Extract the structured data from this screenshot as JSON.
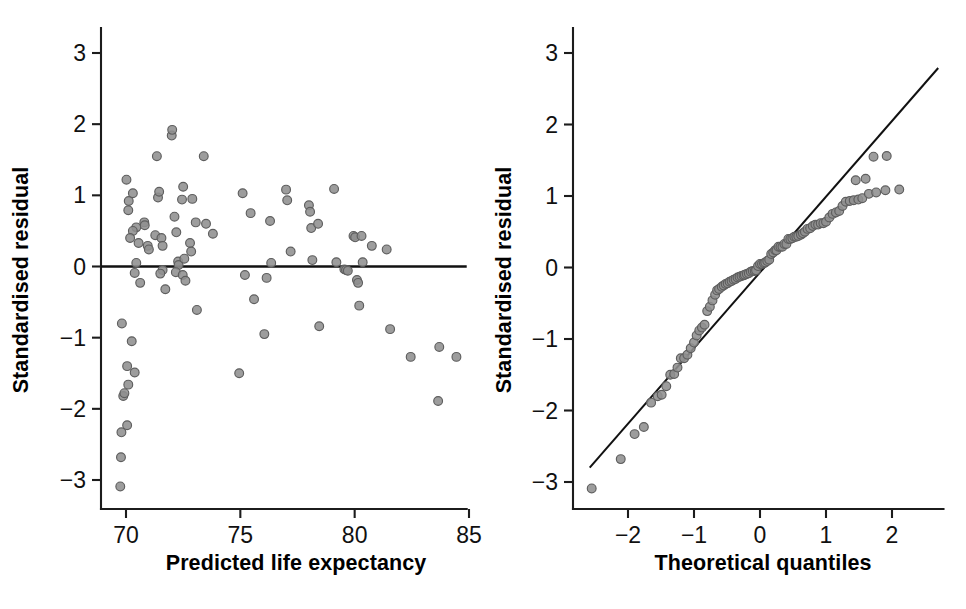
{
  "figure": {
    "background": "#ffffff",
    "point_fill": "#8f8f8f",
    "point_stroke": "#5e5e5e",
    "line_color": "#111111",
    "axis_color": "#1c1c1c",
    "panel_count": 2
  },
  "chart_data": [
    {
      "type": "scatter",
      "panel": "left",
      "title": "",
      "xlabel": "Predicted life expectancy",
      "ylabel": "Standardised residual",
      "xlim": [
        69.2,
        84.9
      ],
      "ylim": [
        -3.35,
        3.4
      ],
      "xticks": [
        70,
        75,
        80,
        85
      ],
      "xtick_labels": [
        "70",
        "75",
        "80",
        "85"
      ],
      "yticks": [
        -3,
        -2,
        -1,
        0,
        1,
        2,
        3
      ],
      "ytick_labels": [
        "−3",
        "−2",
        "−1",
        "0",
        "1",
        "2",
        "3"
      ],
      "grid": false,
      "legend": "none",
      "annotations": [
        {
          "kind": "hline",
          "y": 0,
          "label": "zero residual reference line"
        }
      ],
      "points": [
        [
          69.75,
          -3.09
        ],
        [
          69.78,
          -2.68
        ],
        [
          69.8,
          -2.33
        ],
        [
          70.05,
          -2.23
        ],
        [
          69.88,
          -1.82
        ],
        [
          69.93,
          -1.78
        ],
        [
          70.1,
          -1.66
        ],
        [
          70.05,
          -1.4
        ],
        [
          70.38,
          -1.49
        ],
        [
          70.25,
          -1.05
        ],
        [
          69.82,
          -0.8
        ],
        [
          70.02,
          1.22
        ],
        [
          70.12,
          0.92
        ],
        [
          70.1,
          0.79
        ],
        [
          70.3,
          1.03
        ],
        [
          70.45,
          0.55
        ],
        [
          70.3,
          0.5
        ],
        [
          70.18,
          0.4
        ],
        [
          70.55,
          0.33
        ],
        [
          70.45,
          0.05
        ],
        [
          70.38,
          -0.09
        ],
        [
          70.62,
          -0.23
        ],
        [
          70.8,
          0.62
        ],
        [
          70.82,
          0.58
        ],
        [
          70.95,
          0.29
        ],
        [
          71.0,
          0.24
        ],
        [
          71.35,
          1.55
        ],
        [
          71.4,
          0.97
        ],
        [
          71.45,
          1.05
        ],
        [
          71.28,
          0.44
        ],
        [
          71.55,
          0.4
        ],
        [
          71.6,
          0.29
        ],
        [
          71.6,
          -0.05
        ],
        [
          71.5,
          -0.1
        ],
        [
          71.72,
          -0.32
        ],
        [
          72.0,
          1.84
        ],
        [
          72.02,
          1.92
        ],
        [
          72.12,
          0.7
        ],
        [
          72.2,
          0.48
        ],
        [
          72.28,
          0.07
        ],
        [
          72.3,
          0.02
        ],
        [
          72.18,
          -0.08
        ],
        [
          72.45,
          0.94
        ],
        [
          72.5,
          1.12
        ],
        [
          72.55,
          0.11
        ],
        [
          72.48,
          -0.12
        ],
        [
          72.6,
          -0.2
        ],
        [
          72.8,
          0.33
        ],
        [
          72.85,
          0.21
        ],
        [
          72.9,
          0.95
        ],
        [
          73.05,
          0.62
        ],
        [
          73.1,
          -0.61
        ],
        [
          73.4,
          1.55
        ],
        [
          73.5,
          0.6
        ],
        [
          73.8,
          0.46
        ],
        [
          74.95,
          -1.5
        ],
        [
          75.1,
          1.03
        ],
        [
          75.2,
          -0.12
        ],
        [
          75.45,
          0.75
        ],
        [
          75.6,
          -0.46
        ],
        [
          76.05,
          -0.95
        ],
        [
          76.15,
          -0.16
        ],
        [
          76.3,
          0.64
        ],
        [
          76.35,
          0.05
        ],
        [
          77.0,
          1.08
        ],
        [
          77.05,
          0.93
        ],
        [
          77.2,
          0.21
        ],
        [
          78.0,
          0.86
        ],
        [
          78.05,
          0.77
        ],
        [
          78.1,
          0.54
        ],
        [
          78.15,
          0.09
        ],
        [
          78.4,
          0.6
        ],
        [
          78.45,
          -0.84
        ],
        [
          79.1,
          1.09
        ],
        [
          79.2,
          0.06
        ],
        [
          79.55,
          -0.04
        ],
        [
          79.62,
          -0.05
        ],
        [
          79.7,
          -0.06
        ],
        [
          79.95,
          0.43
        ],
        [
          80.02,
          0.41
        ],
        [
          80.1,
          -0.19
        ],
        [
          80.15,
          -0.23
        ],
        [
          80.3,
          0.43
        ],
        [
          80.35,
          0.06
        ],
        [
          80.2,
          -0.55
        ],
        [
          80.75,
          0.29
        ],
        [
          81.4,
          0.24
        ],
        [
          81.55,
          -0.88
        ],
        [
          82.45,
          -1.27
        ],
        [
          83.7,
          -1.13
        ],
        [
          83.65,
          -1.89
        ],
        [
          84.45,
          -1.27
        ]
      ]
    },
    {
      "type": "scatter",
      "panel": "right",
      "title": "",
      "xlabel": "Theoretical quantiles",
      "ylabel": "Standardised residual",
      "xlim": [
        -2.78,
        2.78
      ],
      "ylim": [
        -3.35,
        3.4
      ],
      "xticks": [
        -2,
        -1,
        0,
        1,
        2
      ],
      "xtick_labels": [
        "−2",
        "−1",
        "0",
        "1",
        "2"
      ],
      "yticks": [
        -3,
        -2,
        -1,
        0,
        1,
        2,
        3
      ],
      "ytick_labels": [
        "−3",
        "−2",
        "−1",
        "0",
        "1",
        "2",
        "3"
      ],
      "grid": false,
      "legend": "none",
      "annotations": [
        {
          "kind": "qqline",
          "x0": -2.58,
          "y0": -2.8,
          "x1": 2.7,
          "y1": 2.79,
          "label": "theoretical normal reference line"
        }
      ],
      "points": [
        [
          -2.55,
          -3.09
        ],
        [
          -2.11,
          -2.68
        ],
        [
          -1.9,
          -2.33
        ],
        [
          -1.76,
          -2.23
        ],
        [
          -1.65,
          -1.89
        ],
        [
          -1.55,
          -1.8
        ],
        [
          -1.49,
          -1.78
        ],
        [
          -1.42,
          -1.66
        ],
        [
          -1.36,
          -1.5
        ],
        [
          -1.3,
          -1.49
        ],
        [
          -1.25,
          -1.4
        ],
        [
          -1.2,
          -1.27
        ],
        [
          -1.15,
          -1.27
        ],
        [
          -1.1,
          -1.22
        ],
        [
          -1.05,
          -1.13
        ],
        [
          -1.0,
          -1.05
        ],
        [
          -0.96,
          -0.95
        ],
        [
          -0.92,
          -0.88
        ],
        [
          -0.88,
          -0.84
        ],
        [
          -0.84,
          -0.8
        ],
        [
          -0.8,
          -0.61
        ],
        [
          -0.76,
          -0.55
        ],
        [
          -0.72,
          -0.46
        ],
        [
          -0.68,
          -0.38
        ],
        [
          -0.65,
          -0.32
        ],
        [
          -0.62,
          -0.3
        ],
        [
          -0.58,
          -0.27
        ],
        [
          -0.55,
          -0.25
        ],
        [
          -0.52,
          -0.23
        ],
        [
          -0.49,
          -0.22
        ],
        [
          -0.46,
          -0.2
        ],
        [
          -0.43,
          -0.19
        ],
        [
          -0.4,
          -0.17
        ],
        [
          -0.37,
          -0.16
        ],
        [
          -0.34,
          -0.14
        ],
        [
          -0.31,
          -0.13
        ],
        [
          -0.28,
          -0.12
        ],
        [
          -0.25,
          -0.11
        ],
        [
          -0.23,
          -0.1
        ],
        [
          -0.2,
          -0.09
        ],
        [
          -0.17,
          -0.08
        ],
        [
          -0.14,
          -0.06
        ],
        [
          -0.11,
          -0.05
        ],
        [
          -0.08,
          -0.05
        ],
        [
          -0.06,
          -0.04
        ],
        [
          -0.03,
          0.02
        ],
        [
          0.0,
          0.05
        ],
        [
          0.03,
          0.05
        ],
        [
          0.06,
          0.06
        ],
        [
          0.08,
          0.07
        ],
        [
          0.11,
          0.09
        ],
        [
          0.14,
          0.11
        ],
        [
          0.17,
          0.19
        ],
        [
          0.2,
          0.21
        ],
        [
          0.23,
          0.24
        ],
        [
          0.25,
          0.24
        ],
        [
          0.28,
          0.29
        ],
        [
          0.31,
          0.29
        ],
        [
          0.34,
          0.29
        ],
        [
          0.37,
          0.33
        ],
        [
          0.4,
          0.33
        ],
        [
          0.43,
          0.4
        ],
        [
          0.46,
          0.4
        ],
        [
          0.49,
          0.41
        ],
        [
          0.52,
          0.43
        ],
        [
          0.55,
          0.43
        ],
        [
          0.58,
          0.44
        ],
        [
          0.62,
          0.46
        ],
        [
          0.65,
          0.48
        ],
        [
          0.68,
          0.5
        ],
        [
          0.72,
          0.54
        ],
        [
          0.76,
          0.55
        ],
        [
          0.8,
          0.58
        ],
        [
          0.84,
          0.6
        ],
        [
          0.88,
          0.6
        ],
        [
          0.92,
          0.62
        ],
        [
          0.96,
          0.62
        ],
        [
          1.0,
          0.64
        ],
        [
          1.05,
          0.7
        ],
        [
          1.1,
          0.75
        ],
        [
          1.15,
          0.77
        ],
        [
          1.2,
          0.79
        ],
        [
          1.25,
          0.86
        ],
        [
          1.3,
          0.92
        ],
        [
          1.36,
          0.93
        ],
        [
          1.42,
          0.94
        ],
        [
          1.49,
          0.95
        ],
        [
          1.55,
          0.97
        ],
        [
          1.65,
          1.03
        ],
        [
          1.76,
          1.05
        ],
        [
          1.9,
          1.08
        ],
        [
          2.11,
          1.09
        ],
        [
          1.45,
          1.22
        ],
        [
          1.6,
          1.24
        ],
        [
          1.72,
          1.55
        ],
        [
          1.92,
          1.56
        ]
      ]
    }
  ],
  "panels": {
    "left": {
      "xlabel": "Predicted life expectancy",
      "ylabel": "Standardised residual",
      "xtick_labels": [
        "70",
        "75",
        "80",
        "85"
      ],
      "ytick_labels": [
        "3",
        "2",
        "1",
        "0",
        "−1",
        "−2",
        "−3"
      ]
    },
    "right": {
      "xlabel": "Theoretical quantiles",
      "ylabel": "Standardised residual",
      "xtick_labels": [
        "−2",
        "−1",
        "0",
        "1",
        "2"
      ],
      "ytick_labels": [
        "3",
        "2",
        "1",
        "0",
        "−1",
        "−2",
        "−3"
      ]
    }
  }
}
